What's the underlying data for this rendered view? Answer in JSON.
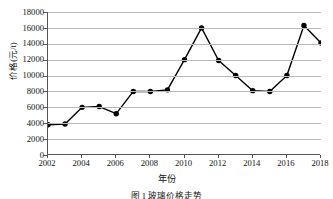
{
  "chart_data": {
    "type": "line",
    "title": "",
    "xlabel": "年份",
    "ylabel": "价格(元/t)",
    "categories": [
      2002,
      2003,
      2004,
      2005,
      2006,
      2007,
      2008,
      2009,
      2010,
      2011,
      2012,
      2013,
      2014,
      2015,
      2016,
      2017,
      2018
    ],
    "values": [
      3800,
      3900,
      6000,
      6100,
      5200,
      8000,
      8000,
      8200,
      12000,
      16000,
      11900,
      10000,
      8100,
      8000,
      10000,
      16300,
      14100
    ],
    "xlim": [
      2002,
      2018
    ],
    "ylim": [
      0,
      18000
    ],
    "ytick_labels": [
      "18000",
      "16000",
      "14000",
      "12000",
      "10000",
      "8000",
      "6000",
      "4000",
      "2000",
      "0"
    ],
    "ytick_values": [
      18000,
      16000,
      14000,
      12000,
      10000,
      8000,
      6000,
      4000,
      2000,
      0
    ],
    "xtick_labels": [
      "2002",
      "2004",
      "2006",
      "2008",
      "2010",
      "2012",
      "2014",
      "2016",
      "2018"
    ],
    "xtick_values": [
      2002,
      2004,
      2006,
      2008,
      2010,
      2012,
      2014,
      2016,
      2018
    ],
    "grid": "horizontal",
    "legend": "none",
    "marker": "filled-circle",
    "line_color": "#000000",
    "marker_color": "#000000",
    "grid_color": "#b9b9b9",
    "axis_color": "#555555"
  },
  "caption": "图 1  玻璃价格走势"
}
